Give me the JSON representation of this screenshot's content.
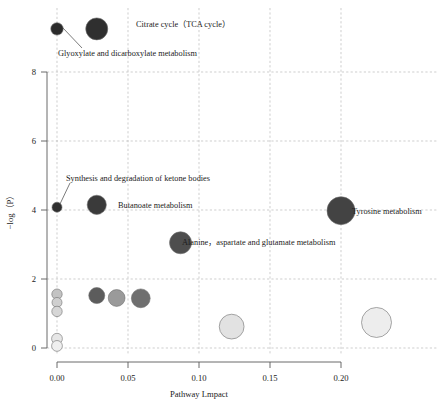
{
  "chart_data": {
    "type": "scatter",
    "title": "",
    "xlabel": "Pathway Lmpact",
    "ylabel": "−log（P）",
    "xlim": [
      -0.012,
      0.245
    ],
    "ylim": [
      -0.45,
      9.6
    ],
    "xticks": [
      "0.00",
      "0.05",
      "0.10",
      "0.15",
      "0.20"
    ],
    "xtick_values": [
      0.0,
      0.05,
      0.1,
      0.15,
      0.2
    ],
    "yticks": [
      "0",
      "2",
      "4",
      "6",
      "8"
    ],
    "ytick_values": [
      0,
      2,
      4,
      6,
      8
    ],
    "grid": true,
    "legend": "none",
    "size_encodes": "pathway impact / hit count",
    "color_encodes": "-log(P) significance (dark = more significant)",
    "points": [
      {
        "label": "Glyoxylate and dicarboxylate metabolism",
        "x": 0.0,
        "y": 9.25,
        "size": 6.2,
        "color": "#2b2b2b",
        "labeled": true
      },
      {
        "label": "Citrate cycle（TCA cycle）",
        "x": 0.028,
        "y": 9.25,
        "size": 11.0,
        "color": "#2f2f2f",
        "labeled": true
      },
      {
        "label": "Synthesis and degradation of ketone bodies",
        "x": 0.0,
        "y": 4.08,
        "size": 5.0,
        "color": "#303030",
        "labeled": true
      },
      {
        "label": "Butanoate metabolism",
        "x": 0.028,
        "y": 4.15,
        "size": 9.6,
        "color": "#3a3a3a",
        "labeled": true
      },
      {
        "label": "Tyrosine metabolism",
        "x": 0.2,
        "y": 3.98,
        "size": 14.0,
        "color": "#434343",
        "labeled": true
      },
      {
        "label": "Alanine，aspartate and glutamate metabolism",
        "x": 0.087,
        "y": 3.05,
        "size": 11.0,
        "color": "#4e4e4e",
        "labeled": true
      },
      {
        "label": "",
        "x": 0.0,
        "y": 1.56,
        "size": 5.2,
        "color": "#c3c3c3",
        "labeled": false
      },
      {
        "label": "",
        "x": 0.0,
        "y": 1.32,
        "size": 5.0,
        "color": "#cfcfcf",
        "labeled": false
      },
      {
        "label": "",
        "x": 0.0,
        "y": 1.06,
        "size": 5.2,
        "color": "#d6d6d6",
        "labeled": false
      },
      {
        "label": "",
        "x": 0.0,
        "y": 0.27,
        "size": 5.4,
        "color": "#e6e6e6",
        "labeled": false
      },
      {
        "label": "",
        "x": 0.0,
        "y": 0.06,
        "size": 5.4,
        "color": "#efefef",
        "labeled": false
      },
      {
        "label": "",
        "x": 0.028,
        "y": 1.52,
        "size": 8.0,
        "color": "#5c5c5c",
        "labeled": false
      },
      {
        "label": "",
        "x": 0.042,
        "y": 1.45,
        "size": 8.4,
        "color": "#9a9a9a",
        "labeled": false
      },
      {
        "label": "",
        "x": 0.059,
        "y": 1.44,
        "size": 9.4,
        "color": "#6f6f6f",
        "labeled": false
      },
      {
        "label": "",
        "x": 0.123,
        "y": 0.62,
        "size": 12.4,
        "color": "#e2e2e2",
        "labeled": false
      },
      {
        "label": "",
        "x": 0.225,
        "y": 0.74,
        "size": 15.0,
        "color": "#ededed",
        "labeled": false
      }
    ],
    "annotations": [
      {
        "text": "Citrate cycle（TCA cycle）",
        "anchor": "right-of-bubble"
      },
      {
        "text": "Glyoxylate and dicarboxylate metabolism",
        "anchor": "leader-line"
      },
      {
        "text": "Synthesis and degradation of ketone bodies",
        "anchor": "leader-line"
      },
      {
        "text": "Butanoate metabolism",
        "anchor": "right-of-bubble"
      },
      {
        "text": "Tyrosine metabolism",
        "anchor": "right-of-bubble"
      },
      {
        "text": "Alanine，aspartate and glutamate metabolism",
        "anchor": "right-of-bubble"
      }
    ]
  }
}
